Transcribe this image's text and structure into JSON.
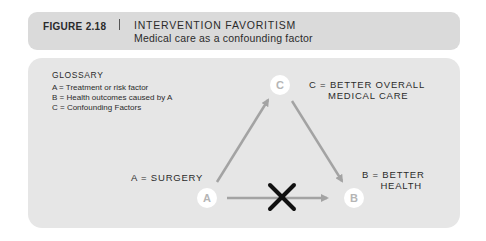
{
  "header": {
    "figure_number": "FIGURE 2.18",
    "title": "INTERVENTION FAVORITISM",
    "subtitle": "Medical care as a confounding factor"
  },
  "glossary": {
    "title": "GLOSSARY",
    "items": [
      "A = Treatment or risk factor",
      "B = Health outcomes caused by A",
      "C = Confounding Factors"
    ]
  },
  "nodes": {
    "a": {
      "letter": "A",
      "caption": "A = SURGERY"
    },
    "b": {
      "letter": "B",
      "caption_line1": "B = BETTER",
      "caption_line2": "HEALTH"
    },
    "c": {
      "letter": "C",
      "caption_line1": "C = BETTER OVERALL",
      "caption_line2": "MEDICAL CARE"
    }
  },
  "edges": [
    {
      "from": "A",
      "to": "C",
      "status": "causal"
    },
    {
      "from": "C",
      "to": "B",
      "status": "causal"
    },
    {
      "from": "A",
      "to": "B",
      "status": "crossed-out"
    }
  ],
  "colors": {
    "header_bg": "#dadada",
    "panel_bg": "#e6e6e6",
    "arrow": "#a3a3a3",
    "node_fill": "#ffffff",
    "node_text": "#b5b5b5",
    "cross": "#111111"
  }
}
